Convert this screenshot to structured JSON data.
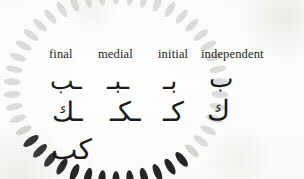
{
  "page": {
    "kind": "scanned-book-page",
    "background_color": "#fbfbfa",
    "width": 304,
    "height": 179
  },
  "ornament": {
    "name": "petal-ring",
    "shape": "ring-of-teardrop-petals",
    "petal_count": 46,
    "center_x": 116,
    "center_y": 88,
    "radius_x": 104,
    "radius_y": 92,
    "dark_color": "#16161a",
    "light_color": "#c9cac6",
    "dark_petal_start_index": 18,
    "dark_petal_end_index": 30
  },
  "table": {
    "headers": [
      {
        "id": "final",
        "label": "final"
      },
      {
        "id": "medial",
        "label": "medial"
      },
      {
        "id": "initial",
        "label": "initial"
      },
      {
        "id": "independent",
        "label": "independent"
      }
    ],
    "rows": [
      {
        "id": "beh",
        "letter_name": "beh",
        "cells": {
          "final": "ـب",
          "medial": "ـبـ",
          "initial": "بـ",
          "independent": "ب"
        }
      },
      {
        "id": "kaf",
        "letter_name": "kaf",
        "cells": {
          "final": "ـك",
          "medial": "ـكـ",
          "initial": "كـ",
          "independent": "ك"
        }
      },
      {
        "id": "ligature",
        "letter_name": "kaf-beh ligature",
        "cells": {
          "final": "كب",
          "medial": "",
          "initial": "",
          "independent": ""
        }
      }
    ]
  },
  "colors": {
    "text": "#232323",
    "glyph": "#1b1b1b",
    "ornament_dark": "#16161a",
    "ornament_light": "#c9cac6",
    "paper": "#fbfbfa"
  }
}
